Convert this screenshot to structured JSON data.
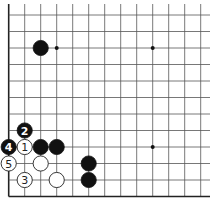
{
  "board": {
    "columns": 13,
    "rows": 12,
    "origin_x": 8.7,
    "origin_y": 15,
    "spacing_x": 16,
    "spacing_y": 16.5,
    "line_extend_right": 210,
    "line_extend_top": 4,
    "edges": [
      "left",
      "bottom"
    ],
    "colors": {
      "line": "#555555",
      "edge": "#222222",
      "black": "#111111",
      "white": "#ffffff"
    }
  },
  "star_points": [
    {
      "col": 3,
      "row": 2
    },
    {
      "col": 9,
      "row": 2
    },
    {
      "col": 9,
      "row": 8
    }
  ],
  "stones": [
    {
      "color": "black",
      "col": 2,
      "row": 2,
      "label": ""
    },
    {
      "color": "black",
      "col": 1,
      "row": 7,
      "label": "2"
    },
    {
      "color": "black",
      "col": 0,
      "row": 8,
      "label": "4"
    },
    {
      "color": "white",
      "col": 1,
      "row": 8,
      "label": "1"
    },
    {
      "color": "black",
      "col": 2,
      "row": 8,
      "label": ""
    },
    {
      "color": "black",
      "col": 3,
      "row": 8,
      "label": ""
    },
    {
      "color": "white",
      "col": 0,
      "row": 9,
      "label": "5"
    },
    {
      "color": "white",
      "col": 2,
      "row": 9,
      "label": ""
    },
    {
      "color": "black",
      "col": 5,
      "row": 9,
      "label": ""
    },
    {
      "color": "white",
      "col": 1,
      "row": 10,
      "label": "3"
    },
    {
      "color": "white",
      "col": 3,
      "row": 10,
      "label": ""
    },
    {
      "color": "black",
      "col": 5,
      "row": 10,
      "label": ""
    }
  ]
}
